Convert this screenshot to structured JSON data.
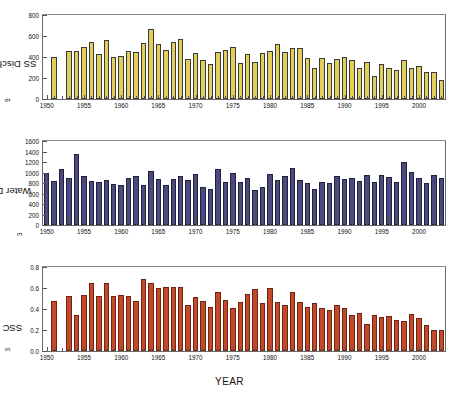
{
  "figure": {
    "xlabel": "YEAR",
    "panels": [
      "ss_discharge",
      "water_discharge",
      "ssc"
    ]
  },
  "chart_data": [
    {
      "type": "bar",
      "id": "ss_discharge",
      "title": "",
      "xlabel": "YEAR",
      "ylabel": "SS Discharge (10⁹kg)",
      "ylabel_base": "SS Discharge (10",
      "ylabel_exp": "9",
      "ylabel_tail": "kg)",
      "ylim": [
        0,
        800
      ],
      "yticks": [
        0,
        200,
        400,
        600,
        800
      ],
      "ytick_labels": [
        "0",
        "200",
        "400",
        "600",
        "800"
      ],
      "xlim": [
        1949.5,
        2003.5
      ],
      "xticks": [
        1950,
        1955,
        1960,
        1965,
        1970,
        1975,
        1980,
        1985,
        1990,
        1995,
        2000
      ],
      "xtick_labels": [
        "1950",
        "1955",
        "1960",
        "1965",
        "1970",
        "1975",
        "1980",
        "1985",
        "1990",
        "1995",
        "2000"
      ],
      "grid": false,
      "legend": null,
      "color": "#e3ce5a",
      "x": [
        1951,
        1953,
        1954,
        1955,
        1956,
        1957,
        1958,
        1959,
        1960,
        1961,
        1962,
        1963,
        1964,
        1965,
        1966,
        1967,
        1968,
        1969,
        1970,
        1971,
        1972,
        1973,
        1974,
        1975,
        1976,
        1977,
        1978,
        1979,
        1980,
        1981,
        1982,
        1983,
        1984,
        1985,
        1986,
        1987,
        1988,
        1989,
        1990,
        1991,
        1992,
        1993,
        1994,
        1995,
        1996,
        1997,
        1998,
        1999,
        2000,
        2001,
        2002,
        2003
      ],
      "values": [
        400,
        460,
        455,
        492,
        546,
        430,
        562,
        398,
        407,
        462,
        452,
        530,
        668,
        525,
        470,
        545,
        575,
        385,
        443,
        370,
        333,
        447,
        465,
        492,
        345,
        430,
        357,
        438,
        458,
        524,
        452,
        484,
        486,
        388,
        297,
        387,
        341,
        378,
        402,
        374,
        291,
        348,
        222,
        333,
        297,
        280,
        375,
        299,
        318,
        253,
        253,
        184
      ]
    },
    {
      "type": "bar",
      "id": "water_discharge",
      "title": "",
      "xlabel": "YEAR",
      "ylabel": "Water Discharge (10⁸m³)",
      "ylabel_base": "Water Discharge (10",
      "ylabel_exp": "8",
      "ylabel_tail": "m",
      "ylabel_tail_exp": "3",
      "ylabel_tail2": ")",
      "ylim": [
        0,
        1600
      ],
      "yticks": [
        0,
        200,
        400,
        600,
        800,
        1000,
        1200,
        1400,
        1600
      ],
      "ytick_labels": [
        "0",
        "200",
        "400",
        "600",
        "800",
        "1000",
        "1200",
        "1400",
        "1600"
      ],
      "xlim": [
        1949.5,
        2003.5
      ],
      "xticks": [
        1950,
        1955,
        1960,
        1965,
        1970,
        1975,
        1980,
        1985,
        1990,
        1995,
        2000
      ],
      "xtick_labels": [
        "1950",
        "1955",
        "1960",
        "1965",
        "1970",
        "1975",
        "1980",
        "1985",
        "1990",
        "1995",
        "2000"
      ],
      "grid": false,
      "legend": null,
      "color": "#4c4a7d",
      "x": [
        1950,
        1951,
        1952,
        1953,
        1954,
        1955,
        1956,
        1957,
        1958,
        1959,
        1960,
        1961,
        1962,
        1963,
        1964,
        1965,
        1966,
        1967,
        1968,
        1969,
        1970,
        1971,
        1972,
        1973,
        1974,
        1975,
        1976,
        1977,
        1978,
        1979,
        1980,
        1981,
        1982,
        1983,
        1984,
        1985,
        1986,
        1987,
        1988,
        1989,
        1990,
        1991,
        1992,
        1993,
        1994,
        1995,
        1996,
        1997,
        1998,
        1999,
        2000,
        2001,
        2002,
        2003
      ],
      "values": [
        985,
        835,
        1070,
        895,
        1350,
        930,
        845,
        815,
        860,
        775,
        762,
        900,
        935,
        762,
        1035,
        872,
        765,
        875,
        935,
        855,
        980,
        718,
        680,
        1060,
        828,
        988,
        825,
        897,
        660,
        722,
        980,
        858,
        940,
        1090,
        852,
        800,
        690,
        810,
        800,
        935,
        880,
        905,
        840,
        945,
        825,
        945,
        920,
        818,
        1205,
        1005,
        895,
        795,
        955,
        890
      ]
    },
    {
      "type": "bar",
      "id": "ssc",
      "title": "",
      "xlabel": "YEAR",
      "ylabel": "SSC (kg/m³)",
      "ylabel_base": "SSC (kg/m",
      "ylabel_exp": "3",
      "ylabel_tail": ")",
      "ylim": [
        0.0,
        0.8
      ],
      "yticks": [
        0.0,
        0.2,
        0.4,
        0.6,
        0.8
      ],
      "ytick_labels": [
        "0.0",
        "0.2",
        "0.4",
        "0.6",
        "0.8"
      ],
      "xlim": [
        1949.5,
        2003.5
      ],
      "xticks": [
        1950,
        1955,
        1960,
        1965,
        1970,
        1975,
        1980,
        1985,
        1990,
        1995,
        2000
      ],
      "xtick_labels": [
        "1950",
        "1955",
        "1960",
        "1965",
        "1970",
        "1975",
        "1980",
        "1985",
        "1990",
        "1995",
        "2000"
      ],
      "grid": false,
      "legend": null,
      "color": "#c4492a",
      "x": [
        1951,
        1953,
        1954,
        1955,
        1956,
        1957,
        1958,
        1959,
        1960,
        1961,
        1962,
        1963,
        1964,
        1965,
        1966,
        1967,
        1968,
        1969,
        1970,
        1971,
        1972,
        1973,
        1974,
        1975,
        1976,
        1977,
        1978,
        1979,
        1980,
        1981,
        1982,
        1983,
        1984,
        1985,
        1986,
        1987,
        1988,
        1989,
        1990,
        1991,
        1992,
        1993,
        1994,
        1995,
        1996,
        1997,
        1998,
        1999,
        2000,
        2001,
        2002,
        2003
      ],
      "values": [
        0.48,
        0.52,
        0.34,
        0.53,
        0.65,
        0.52,
        0.65,
        0.52,
        0.53,
        0.52,
        0.48,
        0.69,
        0.65,
        0.6,
        0.61,
        0.61,
        0.61,
        0.44,
        0.51,
        0.48,
        0.42,
        0.56,
        0.49,
        0.41,
        0.47,
        0.54,
        0.59,
        0.46,
        0.6,
        0.47,
        0.44,
        0.56,
        0.47,
        0.42,
        0.46,
        0.41,
        0.39,
        0.44,
        0.41,
        0.34,
        0.36,
        0.26,
        0.34,
        0.32,
        0.33,
        0.3,
        0.29,
        0.35,
        0.31,
        0.25,
        0.2,
        0.2
      ]
    }
  ]
}
